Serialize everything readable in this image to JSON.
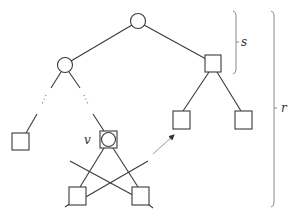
{
  "diagram": {
    "type": "tree",
    "labels": {
      "v": "v",
      "s": "s",
      "r": "r"
    },
    "nodes": [
      {
        "id": "root",
        "shape": "circle"
      },
      {
        "id": "left-internal",
        "shape": "circle"
      },
      {
        "id": "right-internal",
        "shape": "square"
      },
      {
        "id": "left-leaf",
        "shape": "square"
      },
      {
        "id": "v",
        "shape": "square-with-circle"
      },
      {
        "id": "right-left-leaf",
        "shape": "square"
      },
      {
        "id": "right-right-leaf",
        "shape": "square"
      },
      {
        "id": "bottom-left",
        "shape": "square"
      },
      {
        "id": "bottom-right",
        "shape": "square"
      }
    ],
    "brackets": [
      {
        "label": "s",
        "span": "root to right-internal"
      },
      {
        "label": "r",
        "span": "root to bottom leaves"
      }
    ],
    "arrow": {
      "from": "v subtree",
      "to": "right-left-leaf",
      "style": "gray"
    }
  }
}
